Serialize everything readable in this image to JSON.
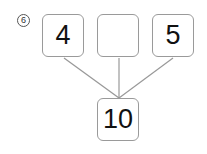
{
  "problem_number": "6",
  "top_boxes": [
    {
      "value": "4"
    },
    {
      "value": ""
    },
    {
      "value": "5"
    }
  ],
  "total_box": {
    "value": "10"
  }
}
